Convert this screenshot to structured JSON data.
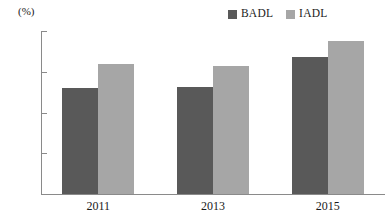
{
  "chart_data": {
    "type": "bar",
    "title": "",
    "xlabel": "",
    "ylabel": "(%)",
    "categories": [
      "2011",
      "2013",
      "2015"
    ],
    "series": [
      {
        "name": "BADL",
        "color": "#595959",
        "values": [
          26.0,
          26.3,
          33.7
        ]
      },
      {
        "name": "IADL",
        "color": "#a6a6a6",
        "values": [
          31.8,
          31.5,
          37.5
        ]
      }
    ],
    "ylim": [
      0,
      40
    ],
    "yticks": [
      0,
      10,
      20,
      30,
      40
    ],
    "ytick_labels": [
      "0",
      "10",
      "20",
      "30",
      "40"
    ],
    "grid": false,
    "legend_position": "top-right"
  },
  "legend": {
    "entries": [
      {
        "label": "BADL",
        "swatch": "legend-swatch-badl"
      },
      {
        "label": "IADL",
        "swatch": "legend-swatch-iadl"
      }
    ]
  },
  "axis": {
    "unit_label": "(%)"
  }
}
